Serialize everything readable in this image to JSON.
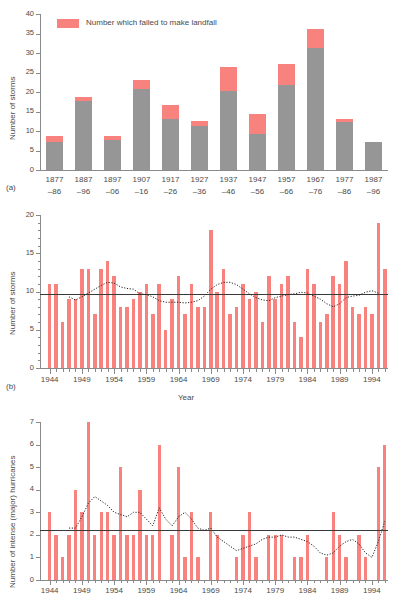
{
  "figure": {
    "panel_tags": [
      "(a)",
      "(b)",
      "(c)"
    ],
    "colors": {
      "bar_red": "#f7827e",
      "bar_grey": "#969696",
      "axis": "#8a8a8a",
      "text": "#4a4a4a",
      "mean_line": "#3a3a3a",
      "smoothed_line": "#222222"
    }
  },
  "chart_data": [
    {
      "id": "panel-a",
      "type": "bar",
      "stacked": true,
      "title": "",
      "xlabel": "",
      "ylabel": "Number of storms",
      "ylim": [
        0,
        40
      ],
      "yticks": [
        0,
        5,
        10,
        15,
        20,
        25,
        30,
        35,
        40
      ],
      "ytick_labels": [
        "0",
        "5",
        "10",
        "15",
        "20",
        "25",
        "30",
        "35",
        "40"
      ],
      "grid": false,
      "legend": {
        "position": "top-left-inside",
        "entries": [
          {
            "label": "Number which failed to make landfall",
            "color": "#f7827e"
          }
        ]
      },
      "categories": [
        "1877–86",
        "1887–96",
        "1897–06",
        "1907–16",
        "1917–26",
        "1927–36",
        "1937–46",
        "1947–56",
        "1957–66",
        "1967–76",
        "1977–86",
        "1987–96"
      ],
      "category_lines": [
        [
          "1877",
          "–86"
        ],
        [
          "1887",
          "–96"
        ],
        [
          "1897",
          "–06"
        ],
        [
          "1907",
          "–16"
        ],
        [
          "1917",
          "–26"
        ],
        [
          "1927",
          "–36"
        ],
        [
          "1937",
          "–46"
        ],
        [
          "1947",
          "–56"
        ],
        [
          "1957",
          "–66"
        ],
        [
          "1967",
          "–76"
        ],
        [
          "1977",
          "–86"
        ],
        [
          "1987",
          "–96"
        ]
      ],
      "series": [
        {
          "name": "Made landfall",
          "color": "#969696",
          "values": [
            7.2,
            17.8,
            7.6,
            20.8,
            13.0,
            11.3,
            20.2,
            9.2,
            21.9,
            31.2,
            12.4,
            7.3
          ]
        },
        {
          "name": "Number which failed to make landfall",
          "color": "#f7827e",
          "values": [
            1.6,
            1.0,
            1.0,
            2.2,
            3.7,
            1.3,
            6.2,
            5.2,
            5.4,
            4.9,
            0.8,
            0.0
          ]
        }
      ],
      "totals": [
        8.8,
        18.8,
        8.6,
        23.0,
        16.7,
        12.6,
        26.4,
        14.4,
        27.3,
        36.1,
        13.2,
        7.3
      ]
    },
    {
      "id": "panel-b",
      "type": "bar",
      "title": "",
      "xlabel": "Year",
      "ylabel": "Number of storms",
      "ylim": [
        0,
        20
      ],
      "yticks": [
        0,
        5,
        10,
        15,
        20
      ],
      "ytick_labels": [
        "0",
        "5",
        "10",
        "15",
        "20"
      ],
      "yminor_step": 1,
      "xticks": [
        1944,
        1949,
        1954,
        1959,
        1964,
        1969,
        1974,
        1979,
        1984,
        1989,
        1994
      ],
      "xtick_labels": [
        "1944",
        "1949",
        "1954",
        "1959",
        "1964",
        "1969",
        "1974",
        "1979",
        "1984",
        "1989",
        "1994"
      ],
      "xlim": [
        1943,
        1997
      ],
      "grid": false,
      "bar_color": "#f7827e",
      "mean_value": 9.7,
      "x": [
        1944,
        1945,
        1946,
        1947,
        1948,
        1949,
        1950,
        1951,
        1952,
        1953,
        1954,
        1955,
        1956,
        1957,
        1958,
        1959,
        1960,
        1961,
        1962,
        1963,
        1964,
        1965,
        1966,
        1967,
        1968,
        1969,
        1970,
        1971,
        1972,
        1973,
        1974,
        1975,
        1976,
        1977,
        1978,
        1979,
        1980,
        1981,
        1982,
        1983,
        1984,
        1985,
        1986,
        1987,
        1988,
        1989,
        1990,
        1991,
        1992,
        1993,
        1994,
        1995,
        1996
      ],
      "values": [
        11,
        11,
        6,
        9,
        9,
        13,
        13,
        7,
        13,
        14,
        12,
        8,
        8,
        9,
        10,
        11,
        7,
        11,
        5,
        9,
        12,
        7,
        11,
        8,
        8,
        18,
        10,
        13,
        7,
        8,
        11,
        9,
        10,
        6,
        12,
        9,
        11,
        12,
        6,
        4,
        13,
        11,
        6,
        7,
        12,
        11,
        14,
        8,
        7,
        8,
        7,
        19,
        13
      ],
      "smoothed_label": "9-year Gaussian smoothed",
      "smoothed": [
        null,
        null,
        null,
        9.3,
        8.9,
        9.3,
        9.8,
        10.3,
        10.8,
        11.2,
        11.1,
        10.6,
        10.4,
        10.3,
        9.7,
        9.6,
        9.3,
        8.8,
        8.6,
        8.6,
        8.6,
        8.5,
        8.6,
        8.8,
        9.4,
        10.3,
        10.9,
        11.2,
        11.2,
        10.9,
        10.3,
        9.7,
        9.2,
        8.9,
        8.8,
        9.2,
        9.4,
        9.6,
        9.7,
        9.9,
        9.8,
        9.4,
        9.0,
        8.4,
        8.0,
        8.4,
        9.2,
        9.4,
        9.5,
        9.9,
        10.1,
        9.8,
        null
      ]
    },
    {
      "id": "panel-c",
      "type": "bar",
      "title": "",
      "xlabel": "",
      "ylabel": "Number of intense (major) hurricanes",
      "ylim": [
        0,
        7
      ],
      "yticks": [
        0,
        1,
        2,
        3,
        4,
        5,
        6,
        7
      ],
      "ytick_labels": [
        "0",
        "1",
        "2",
        "3",
        "4",
        "5",
        "6",
        "7"
      ],
      "xticks": [
        1944,
        1949,
        1954,
        1959,
        1964,
        1969,
        1974,
        1979,
        1984,
        1989,
        1994
      ],
      "xtick_labels": [
        "1944",
        "1949",
        "1954",
        "1959",
        "1964",
        "1969",
        "1974",
        "1979",
        "1984",
        "1989",
        "1994"
      ],
      "xlim": [
        1943,
        1997
      ],
      "grid": false,
      "bar_color": "#f7827e",
      "mean_value": 2.2,
      "x": [
        1944,
        1945,
        1946,
        1947,
        1948,
        1949,
        1950,
        1951,
        1952,
        1953,
        1954,
        1955,
        1956,
        1957,
        1958,
        1959,
        1960,
        1961,
        1962,
        1963,
        1964,
        1965,
        1966,
        1967,
        1968,
        1969,
        1970,
        1971,
        1972,
        1973,
        1974,
        1975,
        1976,
        1977,
        1978,
        1979,
        1980,
        1981,
        1982,
        1983,
        1984,
        1985,
        1986,
        1987,
        1988,
        1989,
        1990,
        1991,
        1992,
        1993,
        1994,
        1995,
        1996
      ],
      "values": [
        3,
        2,
        1,
        2,
        4,
        3,
        7,
        2,
        3,
        3,
        2,
        5,
        2,
        2,
        4,
        2,
        2,
        6,
        0,
        2,
        5,
        1,
        3,
        1,
        0,
        3,
        2,
        0,
        0,
        1,
        2,
        3,
        1,
        0,
        2,
        2,
        2,
        0,
        1,
        1,
        2,
        0,
        0,
        1,
        3,
        2,
        1,
        0,
        2,
        1,
        0,
        5,
        6
      ],
      "smoothed_label": "9-year Gaussian smoothed",
      "smoothed": [
        null,
        null,
        null,
        2.3,
        2.3,
        2.8,
        3.4,
        3.7,
        3.5,
        3.3,
        3.0,
        2.9,
        2.8,
        3.0,
        3.0,
        2.7,
        2.4,
        3.2,
        2.7,
        2.4,
        2.8,
        3.0,
        2.7,
        2.3,
        2.2,
        2.3,
        1.9,
        1.7,
        1.5,
        1.3,
        1.4,
        1.5,
        1.6,
        1.8,
        1.9,
        1.9,
        2.0,
        1.9,
        1.9,
        1.8,
        1.7,
        1.5,
        1.2,
        1.1,
        1.2,
        1.5,
        1.7,
        1.8,
        1.6,
        1.2,
        1.0,
        1.7,
        2.6
      ]
    }
  ]
}
